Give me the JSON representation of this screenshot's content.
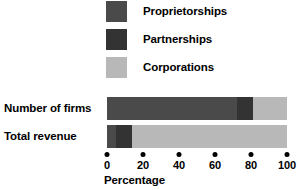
{
  "chart_data": {
    "type": "bar",
    "orientation": "horizontal",
    "stacked": true,
    "title": "",
    "xlabel": "Percentage",
    "ylabel": "",
    "xlim": [
      0,
      100
    ],
    "xticks": [
      0,
      20,
      40,
      60,
      80,
      100
    ],
    "xtick_labels": [
      "0",
      "20",
      "40",
      "60",
      "80",
      "100"
    ],
    "grid": false,
    "legend_position": "top",
    "categories": [
      "Number of firms",
      "Total revenue"
    ],
    "series": [
      {
        "name": "Proprietorships",
        "color": "#4a4a4a",
        "values": [
          72,
          5
        ]
      },
      {
        "name": "Partnerships",
        "color": "#333333",
        "values": [
          9,
          9
        ]
      },
      {
        "name": "Corporations",
        "color": "#b8b8b8",
        "values": [
          19,
          86
        ]
      }
    ]
  },
  "legend": {
    "items": [
      {
        "label": "Proprietorships",
        "swatch_name": "legend-swatch-proprietorships",
        "color": "#4a4a4a"
      },
      {
        "label": "Partnerships",
        "swatch_name": "legend-swatch-partnerships",
        "color": "#333333"
      },
      {
        "label": "Corporations",
        "swatch_name": "legend-swatch-corporations",
        "color": "#b8b8b8"
      }
    ]
  },
  "axis": {
    "title": "Percentage",
    "ticks": [
      "0",
      "20",
      "40",
      "60",
      "80",
      "100"
    ]
  },
  "rows": [
    {
      "label": "Number of firms"
    },
    {
      "label": "Total revenue"
    }
  ]
}
